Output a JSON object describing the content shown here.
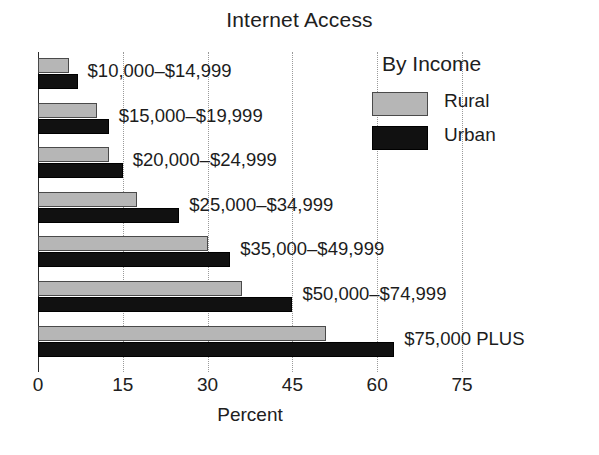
{
  "chart_data": {
    "type": "bar",
    "orientation": "horizontal",
    "title": "Internet Access",
    "xlabel": "Percent",
    "ylabel": "",
    "xlim": [
      0,
      75
    ],
    "grid": true,
    "grid_axis": "x",
    "legend_position": "top-right",
    "legend_title": "By Income",
    "categories": [
      "$10,000–$14,999",
      "$15,000–$19,999",
      "$20,000–$24,999",
      "$25,000–$34,999",
      "$35,000–$49,999",
      "$50,000–$74,999",
      "$75,000 PLUS"
    ],
    "series": [
      {
        "name": "Rural",
        "color": "#b6b6b6",
        "values": [
          5.5,
          10.5,
          12.5,
          17.5,
          30,
          36,
          51
        ]
      },
      {
        "name": "Urban",
        "color": "#111111",
        "values": [
          7,
          12.5,
          15,
          25,
          34,
          45,
          63
        ]
      }
    ],
    "xticks": [
      0,
      15,
      30,
      45,
      60,
      75
    ],
    "xtick_labels": [
      "0",
      "15",
      "30",
      "45",
      "60",
      "75"
    ]
  },
  "axis": {
    "x_title": "Percent"
  },
  "legend": {
    "title": "By Income",
    "entries": [
      {
        "label": "Rural",
        "color": "#b6b6b6"
      },
      {
        "label": "Urban",
        "color": "#111111"
      }
    ]
  }
}
